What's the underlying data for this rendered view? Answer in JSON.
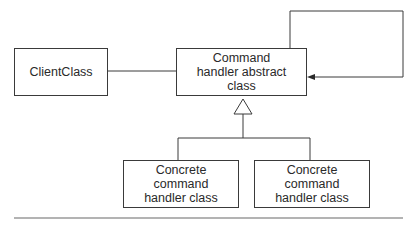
{
  "diagram": {
    "type": "UML class diagram",
    "nodes": {
      "client": {
        "label": "ClientClass"
      },
      "abstract_handler": {
        "label": "Command\nhandler abstract\nclass"
      },
      "concrete1": {
        "label": "Concrete\ncommand\nhandler class"
      },
      "concrete2": {
        "label": "Concrete\ncommand\nhandler class"
      }
    },
    "edges": [
      {
        "from": "client",
        "to": "abstract_handler",
        "kind": "association"
      },
      {
        "from": "abstract_handler",
        "to": "abstract_handler",
        "kind": "self-association (arrow)"
      },
      {
        "from": "concrete1",
        "to": "abstract_handler",
        "kind": "generalization"
      },
      {
        "from": "concrete2",
        "to": "abstract_handler",
        "kind": "generalization"
      }
    ],
    "colors": {
      "line": "#3a3a3a",
      "rule": "#9a9a9a",
      "background": "#ffffff"
    }
  }
}
